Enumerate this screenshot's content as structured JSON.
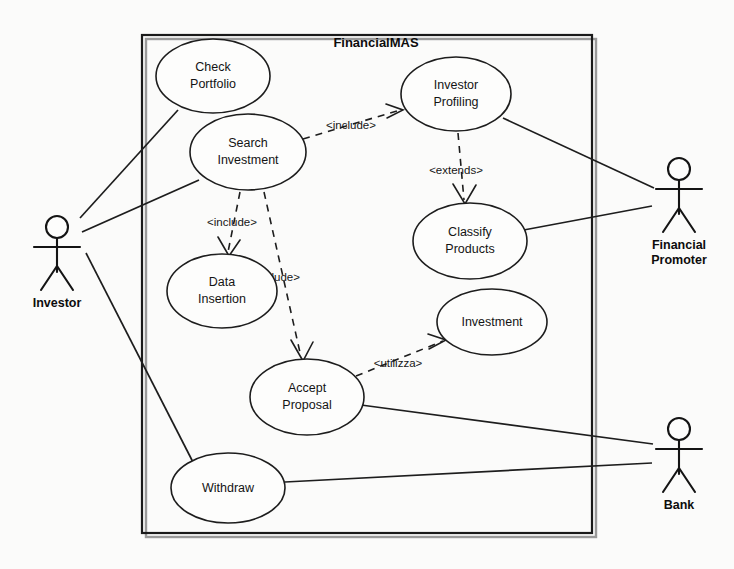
{
  "diagram": {
    "kind": "uml-use-case-diagram",
    "system_boundary": {
      "title": "FinancialMAS",
      "x": 142,
      "y": 35,
      "width": 450,
      "height": 498
    },
    "use_cases": [
      {
        "id": "check-portfolio",
        "label_line1": "Check",
        "label_line2": "Portfolio",
        "cx": 213,
        "cy": 76,
        "rx": 57,
        "ry": 37
      },
      {
        "id": "search-investment",
        "label_line1": "Search",
        "label_line2": "Investment",
        "cx": 248,
        "cy": 152,
        "rx": 58,
        "ry": 38
      },
      {
        "id": "investor-profiling",
        "label_line1": "Investor",
        "label_line2": "Profiling",
        "cx": 456,
        "cy": 94,
        "rx": 55,
        "ry": 37
      },
      {
        "id": "classify-products",
        "label_line1": "Classify",
        "label_line2": "Products",
        "cx": 470,
        "cy": 241,
        "rx": 57,
        "ry": 38
      },
      {
        "id": "data-insertion",
        "label_line1": "Data",
        "label_line2": "Insertion",
        "cx": 222,
        "cy": 291,
        "rx": 55,
        "ry": 37
      },
      {
        "id": "investment",
        "label_line1": "Investment",
        "label_line2": "",
        "cx": 492,
        "cy": 322,
        "rx": 55,
        "ry": 33
      },
      {
        "id": "accept-proposal",
        "label_line1": "Accept",
        "label_line2": "Proposal",
        "cx": 307,
        "cy": 397,
        "rx": 57,
        "ry": 38
      },
      {
        "id": "withdraw",
        "label_line1": "Withdraw",
        "label_line2": "",
        "cx": 228,
        "cy": 488,
        "rx": 57,
        "ry": 35
      }
    ],
    "actors": [
      {
        "id": "investor",
        "label_line1": "Investor",
        "label_line2": "",
        "x": 57,
        "y": 222
      },
      {
        "id": "financial-promoter",
        "label_line1": "Financial",
        "label_line2": "Promoter",
        "x": 679,
        "y": 172
      },
      {
        "id": "bank",
        "label_line1": "Bank",
        "label_line2": "",
        "x": 679,
        "y": 432
      }
    ],
    "relations": [
      {
        "id": "investor-check-portfolio",
        "type": "association",
        "from": "investor",
        "to": "check-portfolio"
      },
      {
        "id": "investor-search-investment",
        "type": "association",
        "from": "investor",
        "to": "search-investment"
      },
      {
        "id": "investor-withdraw",
        "type": "association",
        "from": "investor",
        "to": "withdraw"
      },
      {
        "id": "promoter-investor-profiling",
        "type": "association",
        "from": "financial-promoter",
        "to": "investor-profiling"
      },
      {
        "id": "promoter-classify-products",
        "type": "association",
        "from": "financial-promoter",
        "to": "classify-products"
      },
      {
        "id": "bank-accept-proposal",
        "type": "association",
        "from": "bank",
        "to": "accept-proposal"
      },
      {
        "id": "bank-withdraw",
        "type": "association",
        "from": "bank",
        "to": "withdraw"
      },
      {
        "id": "search-to-profiling",
        "type": "dependency",
        "from": "search-investment",
        "to": "investor-profiling",
        "stereotype": "<include>"
      },
      {
        "id": "search-to-data-insertion",
        "type": "dependency",
        "from": "search-investment",
        "to": "data-insertion",
        "stereotype": "<include>"
      },
      {
        "id": "search-to-accept-proposal",
        "type": "dependency",
        "from": "search-investment",
        "to": "accept-proposal",
        "stereotype": "<include>"
      },
      {
        "id": "profiling-to-classify",
        "type": "dependency",
        "from": "investor-profiling",
        "to": "classify-products",
        "stereotype": "<extends>"
      },
      {
        "id": "accept-proposal-to-investment",
        "type": "dependency",
        "from": "accept-proposal",
        "to": "investment",
        "stereotype": "<utilizza>"
      }
    ],
    "stereotype_labels": [
      {
        "id": "include-profiling",
        "text": "<include>",
        "x": 351,
        "y": 125
      },
      {
        "id": "extends-classify",
        "text": "<extends>",
        "x": 456,
        "y": 170
      },
      {
        "id": "include-data",
        "text": "<include>",
        "x": 232,
        "y": 222
      },
      {
        "id": "include-accept",
        "text": "<include>",
        "x": 275,
        "y": 277
      },
      {
        "id": "utilizza-invest",
        "text": "<utilizza>",
        "x": 398,
        "y": 363
      }
    ],
    "colors": {
      "stroke": "#1d1d1d",
      "ellipse_fill": "#fdfdfc",
      "background": "#fbfbfa",
      "text": "#141414"
    }
  }
}
